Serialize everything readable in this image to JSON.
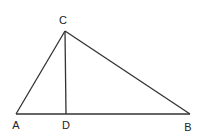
{
  "diagram": {
    "type": "triangle-with-altitude",
    "points": {
      "A": {
        "label": "A",
        "x": 16,
        "y": 114,
        "lx": 16,
        "ly": 129
      },
      "B": {
        "label": "B",
        "x": 190,
        "y": 114,
        "lx": 188,
        "ly": 131
      },
      "C": {
        "label": "C",
        "x": 65,
        "y": 31,
        "lx": 63,
        "ly": 24
      },
      "D": {
        "label": "D",
        "x": 66,
        "y": 114,
        "lx": 66,
        "ly": 129
      }
    },
    "segments": [
      "AC",
      "CB",
      "AB",
      "CD"
    ],
    "stroke_color": "#333333"
  }
}
